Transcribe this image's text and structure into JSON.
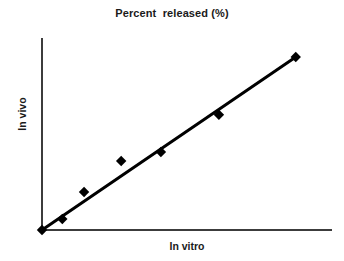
{
  "chart_data": {
    "type": "scatter",
    "title": "Percent  released (%)",
    "xlabel": "In vitro",
    "ylabel": "In vivo",
    "grid": false,
    "legend": false,
    "ticks": false,
    "tick_labels": false,
    "xlim": [
      0,
      1
    ],
    "ylim": [
      0,
      1
    ],
    "series": [
      {
        "name": "In vitro vs in vivo percent released",
        "marker": "diamond",
        "marker_color": "#000000",
        "x": [
          0.0,
          0.07,
          0.145,
          0.273,
          0.41,
          0.61,
          0.875
        ],
        "y": [
          0.0,
          0.057,
          0.198,
          0.359,
          0.406,
          0.6,
          0.901
        ]
      }
    ],
    "fit_line": {
      "name": "linear correlation line",
      "color": "#000000",
      "x": [
        0.0,
        0.875
      ],
      "y": [
        0.0,
        0.901
      ]
    }
  },
  "axes": {
    "y_axis_name": "In vivo",
    "x_axis_name": "In vitro",
    "axis_color": "#3c3c3c"
  },
  "colors": {
    "background": "#ffffff",
    "text": "#1a1a1a",
    "data": "#000000"
  }
}
